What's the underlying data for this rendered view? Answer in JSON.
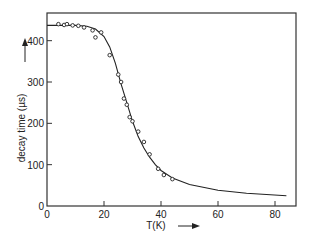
{
  "chart_data": {
    "type": "scatter",
    "title": "",
    "xlabel": "T(K)",
    "ylabel": "decay time (µs)",
    "xlim": [
      0,
      90
    ],
    "ylim": [
      0,
      480
    ],
    "xticks": [
      0,
      20,
      40,
      60,
      80
    ],
    "yticks": [
      0,
      100,
      200,
      300,
      400
    ],
    "grid": false,
    "legend": null,
    "series": [
      {
        "name": "measured",
        "kind": "scatter",
        "marker": "open-circle",
        "x": [
          4,
          6,
          7,
          9,
          11,
          13,
          16,
          17,
          19,
          22,
          25,
          26,
          27,
          28,
          29,
          30,
          32,
          34,
          36,
          39,
          41,
          44
        ],
        "y": [
          440,
          438,
          440,
          437,
          436,
          432,
          425,
          408,
          420,
          365,
          318,
          300,
          260,
          245,
          215,
          205,
          180,
          155,
          125,
          90,
          75,
          65
        ]
      },
      {
        "name": "fit",
        "kind": "line",
        "x": [
          0,
          10,
          14,
          17,
          20,
          22,
          24,
          26,
          28,
          30,
          32,
          34,
          36,
          38,
          40,
          44,
          50,
          60,
          70,
          84
        ],
        "y": [
          437,
          437,
          435,
          428,
          410,
          385,
          345,
          295,
          250,
          205,
          168,
          140,
          118,
          100,
          86,
          68,
          52,
          38,
          31,
          25
        ]
      }
    ]
  }
}
